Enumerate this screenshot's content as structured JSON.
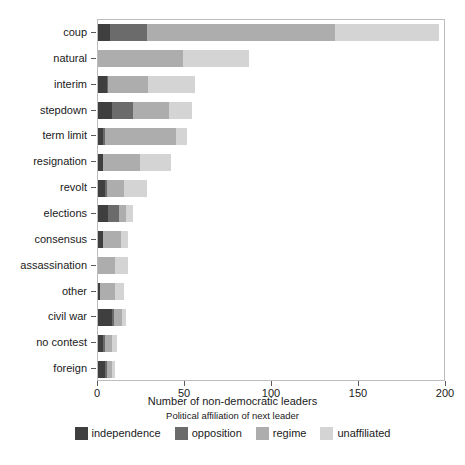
{
  "chart_data": {
    "type": "bar",
    "orientation": "horizontal",
    "stacked": true,
    "title": "",
    "xlabel": "Number of non-democratic leaders",
    "ylabel": "",
    "xlim": [
      0,
      200
    ],
    "xticks": [
      0,
      50,
      100,
      150,
      200
    ],
    "xtick_labels": [
      "0",
      "50",
      "100",
      "150",
      "200"
    ],
    "grid": false,
    "legend_title": "Political affiliation of next leader",
    "legend_position": "bottom",
    "categories": [
      "coup",
      "natural",
      "interim",
      "stepdown",
      "term limit",
      "resignation",
      "revolt",
      "elections",
      "consensus",
      "assassination",
      "other",
      "civil war",
      "no contest",
      "foreign"
    ],
    "series": [
      {
        "name": "independence",
        "color": "#3f3f3f",
        "values": [
          7,
          0,
          5,
          8,
          3,
          3,
          4,
          6,
          3,
          0,
          1,
          8,
          3,
          4
        ]
      },
      {
        "name": "opposition",
        "color": "#6b6b6b",
        "values": [
          21,
          0,
          1,
          12,
          1,
          0,
          1,
          6,
          0,
          0,
          0,
          1,
          1,
          1
        ]
      },
      {
        "name": "regime",
        "color": "#adadad",
        "values": [
          108,
          49,
          23,
          21,
          41,
          21,
          10,
          4,
          10,
          10,
          9,
          5,
          4,
          3
        ]
      },
      {
        "name": "unaffiliated",
        "color": "#d4d4d4",
        "values": [
          60,
          38,
          27,
          13,
          6,
          18,
          13,
          4,
          4,
          7,
          5,
          2,
          3,
          2
        ]
      }
    ],
    "totals": [
      196,
      87,
      56,
      54,
      51,
      42,
      28,
      20,
      17,
      17,
      15,
      16,
      11,
      10
    ]
  },
  "axis": {
    "x_title": "Number of non-democratic leaders"
  },
  "legend": {
    "title": "Political affiliation of next leader",
    "items": [
      {
        "label": "independence",
        "color": "#3f3f3f"
      },
      {
        "label": "opposition",
        "color": "#6b6b6b"
      },
      {
        "label": "regime",
        "color": "#adadad"
      },
      {
        "label": "unaffiliated",
        "color": "#d4d4d4"
      }
    ]
  }
}
